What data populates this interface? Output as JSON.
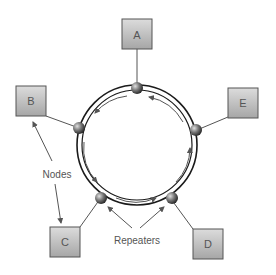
{
  "diagram": {
    "type": "ring-topology",
    "nodes": [
      {
        "id": "A",
        "label": "A"
      },
      {
        "id": "B",
        "label": "B"
      },
      {
        "id": "C",
        "label": "C"
      },
      {
        "id": "D",
        "label": "D"
      },
      {
        "id": "E",
        "label": "E"
      }
    ],
    "annotations": {
      "nodes_label": "Nodes",
      "repeaters_label": "Repeaters"
    },
    "colors": {
      "box_fill_top": "#d9d9d9",
      "box_fill_bottom": "#a8a8a8",
      "box_stroke": "#555555",
      "ring": "#1a1a1a",
      "arrow": "#555555",
      "text": "#555555"
    }
  }
}
